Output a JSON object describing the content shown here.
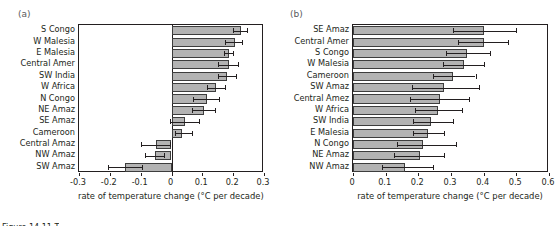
{
  "figure": {
    "caption_sliver": "Figure 14.11 T"
  },
  "panels": [
    {
      "letter": "(a)",
      "xlabel": "rate of temperature change (°C per decade)",
      "xticks": [
        "-0.3",
        "-0.2",
        "-0.1",
        "0",
        "0.1",
        "0.2",
        "0.3"
      ]
    },
    {
      "letter": "(b)",
      "xlabel": "rate of temperature change (°C per decade)",
      "xticks": [
        "0",
        "0.1",
        "0.2",
        "0.3",
        "0.4",
        "0.5",
        "0.6"
      ]
    }
  ],
  "chart_data": [
    {
      "type": "bar",
      "orientation": "horizontal",
      "title": "",
      "panel": "(a)",
      "xlabel": "rate of temperature change (°C per decade)",
      "ylabel": "",
      "xlim": [
        -0.3,
        0.3
      ],
      "xticks": [
        -0.3,
        -0.2,
        -0.1,
        0,
        0.1,
        0.2,
        0.3
      ],
      "grid": false,
      "legend": "none",
      "categories": [
        "S Congo",
        "W Malesia",
        "E Malesia",
        "Central Amer",
        "SW India",
        "W Africa",
        "N Congo",
        "NE Amaz",
        "SE Amaz",
        "Cameroon",
        "Central Amaz",
        "NW Amaz",
        "SW Amaz"
      ],
      "values": [
        0.225,
        0.205,
        0.185,
        0.185,
        0.18,
        0.145,
        0.115,
        0.105,
        0.045,
        0.035,
        -0.05,
        -0.055,
        -0.15
      ],
      "error_low": [
        0.2,
        0.175,
        0.17,
        0.15,
        0.15,
        0.115,
        0.07,
        0.065,
        -0.005,
        0.01,
        -0.1,
        -0.085,
        -0.205
      ],
      "error_high": [
        0.245,
        0.23,
        0.2,
        0.215,
        0.21,
        0.175,
        0.155,
        0.14,
        0.09,
        0.065,
        -0.005,
        -0.025,
        -0.095
      ]
    },
    {
      "type": "bar",
      "orientation": "horizontal",
      "title": "",
      "panel": "(b)",
      "xlabel": "rate of temperature change (°C per decade)",
      "ylabel": "",
      "xlim": [
        0,
        0.6
      ],
      "xticks": [
        0,
        0.1,
        0.2,
        0.3,
        0.4,
        0.5,
        0.6
      ],
      "grid": false,
      "legend": "none",
      "categories": [
        "SE Amaz",
        "Central Amer",
        "S Congo",
        "W Malesia",
        "Cameroon",
        "SW Amaz",
        "Central Amez",
        "W Africa",
        "SW India",
        "E Malesia",
        "N Congo",
        "NE Amaz",
        "NW Amaz"
      ],
      "values": [
        0.4,
        0.4,
        0.35,
        0.34,
        0.305,
        0.28,
        0.265,
        0.26,
        0.24,
        0.23,
        0.215,
        0.205,
        0.16
      ],
      "error_low": [
        0.305,
        0.32,
        0.285,
        0.275,
        0.245,
        0.18,
        0.175,
        0.19,
        0.185,
        0.185,
        0.135,
        0.125,
        0.09
      ],
      "error_high": [
        0.5,
        0.475,
        0.42,
        0.4,
        0.375,
        0.385,
        0.355,
        0.335,
        0.305,
        0.28,
        0.315,
        0.28,
        0.245
      ]
    }
  ]
}
